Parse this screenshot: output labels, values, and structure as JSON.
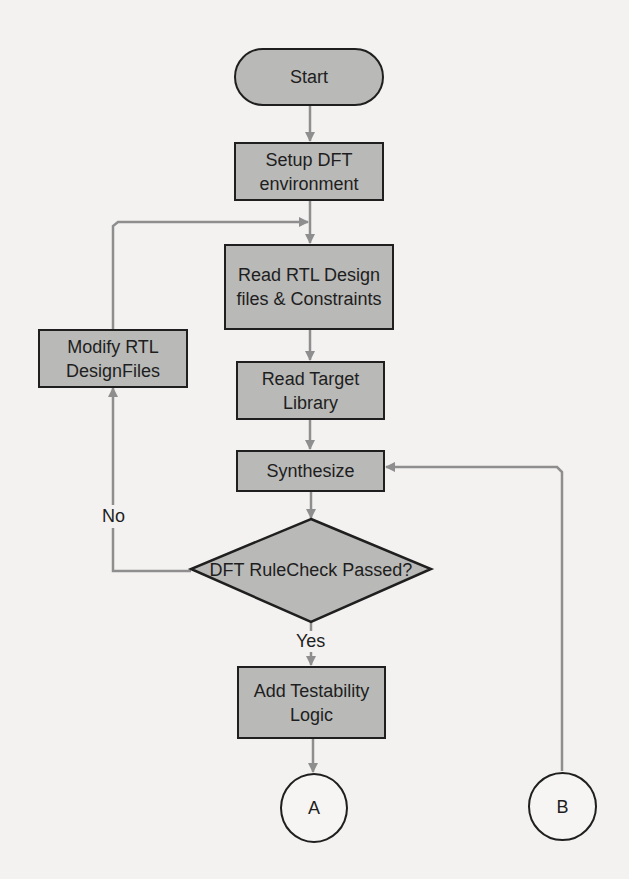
{
  "diagram": {
    "type": "flowchart",
    "colors": {
      "node_fill": "#b9b9b7",
      "node_border": "#1f1f1f",
      "edge": "#8e8e8e",
      "background": "#f3f2f0"
    },
    "nodes": {
      "start": "Start",
      "setup": "Setup DFT environment",
      "setup_l1": "Setup DFT",
      "setup_l2": "environment",
      "read_rtl_l1": "Read RTL Design",
      "read_rtl_l2": "files & Constraints",
      "modify_l1": "Modify RTL",
      "modify_l2": "DesignFiles",
      "read_target_l1": "Read Target",
      "read_target_l2": "Library",
      "synthesize": "Synthesize",
      "decision": "DFT RuleCheck Passed?",
      "add_test_l1": "Add Testability",
      "add_test_l2": "Logic",
      "connector_a": "A",
      "connector_b": "B"
    },
    "edge_labels": {
      "no": "No",
      "yes": "Yes"
    },
    "edges": [
      [
        "Start",
        "Setup DFT environment"
      ],
      [
        "Setup DFT environment",
        "Read RTL Design files & Constraints"
      ],
      [
        "Read RTL Design files & Constraints",
        "Read Target Library"
      ],
      [
        "Read Target Library",
        "Synthesize"
      ],
      [
        "Synthesize",
        "DFT RuleCheck Passed?"
      ],
      [
        "DFT RuleCheck Passed?",
        "Modify RTL DesignFiles",
        "No"
      ],
      [
        "Modify RTL DesignFiles",
        "Read RTL Design files & Constraints"
      ],
      [
        "DFT RuleCheck Passed?",
        "Add Testability Logic",
        "Yes"
      ],
      [
        "Add Testability Logic",
        "A"
      ],
      [
        "B",
        "Synthesize"
      ]
    ]
  }
}
